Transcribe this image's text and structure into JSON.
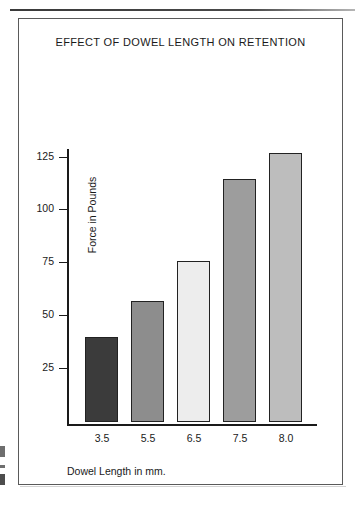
{
  "page": {
    "rule_present": true,
    "edge_marks": [
      "left-edge-mark-upper",
      "left-edge-mark-middle",
      "left-edge-mark-lower"
    ]
  },
  "figure": {
    "title": "EFFECT OF DOWEL LENGTH ON RETENTION"
  },
  "chart_data": {
    "type": "bar",
    "title": "EFFECT OF DOWEL LENGTH ON RETENTION",
    "xlabel": "Dowel Length in mm.",
    "ylabel": "Force in Pounds",
    "categories": [
      "3.5",
      "5.5",
      "6.5",
      "7.5",
      "8.0"
    ],
    "values": [
      40,
      57,
      76,
      115,
      127
    ],
    "ylim": [
      0,
      130
    ],
    "yticks": [
      25,
      50,
      75,
      100,
      125
    ],
    "ytick_labels": [
      "25",
      "50",
      "75",
      "100",
      "125"
    ],
    "grid": false,
    "legend": null,
    "bar_colors": [
      "#3b3b3b",
      "#8d8d8d",
      "#ededed",
      "#9d9d9d",
      "#bdbdbd"
    ],
    "bar_edge_color": "#222222"
  }
}
